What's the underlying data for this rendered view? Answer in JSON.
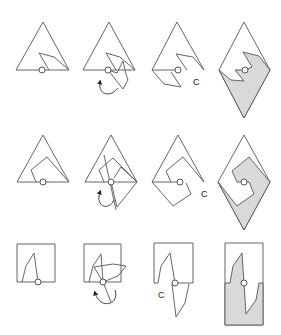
{
  "figure": {
    "colors": {
      "stroke": "#555555",
      "fill": "#d9d9d9",
      "background": "#ffffff"
    },
    "rows": [
      {
        "name": "triangle-a",
        "panels": [
          {
            "step": "base-shape",
            "label": ""
          },
          {
            "step": "rotate-about-pivot",
            "label": "",
            "icon": "rotation-arrow-icon"
          },
          {
            "step": "rotated-copy",
            "label": "C"
          },
          {
            "step": "resulting-tile",
            "label": ""
          }
        ]
      },
      {
        "name": "triangle-b",
        "panels": [
          {
            "step": "base-shape",
            "label": ""
          },
          {
            "step": "rotate-about-pivot",
            "label": "",
            "icon": "rotation-arrow-icon"
          },
          {
            "step": "rotated-copy",
            "label": "C"
          },
          {
            "step": "resulting-tile",
            "label": ""
          }
        ]
      },
      {
        "name": "square",
        "panels": [
          {
            "step": "base-shape",
            "label": ""
          },
          {
            "step": "rotate-about-pivot",
            "label": "",
            "icon": "rotation-arrow-icon"
          },
          {
            "step": "rotated-copy",
            "label": "C"
          },
          {
            "step": "resulting-tile",
            "label": ""
          }
        ]
      }
    ]
  }
}
